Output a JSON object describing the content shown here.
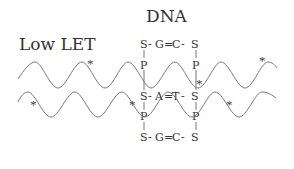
{
  "labels": {
    "radiation": "Low LET",
    "molecule": "DNA"
  },
  "dna": {
    "top_pair": [
      "S",
      "G",
      "C",
      "S"
    ],
    "top_bond": "=",
    "middle_pair": [
      "S",
      "A",
      "T",
      "S"
    ],
    "middle_bond": "=",
    "bottom_pair": [
      "S",
      "G",
      "C",
      "S"
    ],
    "bottom_bond": "=",
    "single_bond": "-",
    "phosphate": "P"
  },
  "markers": {
    "damage_symbol": "*"
  },
  "colors": {
    "line": "#777777",
    "text": "#333333"
  }
}
